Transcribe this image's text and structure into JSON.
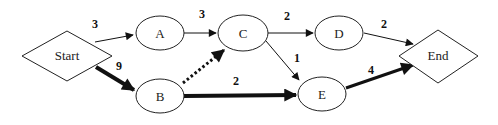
{
  "diagram": {
    "nodes": [
      {
        "id": "start",
        "label": "Start",
        "shape": "diamond"
      },
      {
        "id": "A",
        "label": "A",
        "shape": "ellipse"
      },
      {
        "id": "B",
        "label": "B",
        "shape": "ellipse"
      },
      {
        "id": "C",
        "label": "C",
        "shape": "ellipse"
      },
      {
        "id": "D",
        "label": "D",
        "shape": "ellipse"
      },
      {
        "id": "E",
        "label": "E",
        "shape": "ellipse"
      },
      {
        "id": "end",
        "label": "End",
        "shape": "diamond"
      }
    ],
    "edges": [
      {
        "from": "start",
        "to": "A",
        "weight": "3",
        "style": "thin"
      },
      {
        "from": "start",
        "to": "B",
        "weight": "9",
        "style": "bold"
      },
      {
        "from": "A",
        "to": "C",
        "weight": "3",
        "style": "thin"
      },
      {
        "from": "B",
        "to": "C",
        "weight": "",
        "style": "dotted"
      },
      {
        "from": "B",
        "to": "E",
        "weight": "2",
        "style": "bold"
      },
      {
        "from": "C",
        "to": "D",
        "weight": "2",
        "style": "thin"
      },
      {
        "from": "C",
        "to": "E",
        "weight": "1",
        "style": "thin"
      },
      {
        "from": "D",
        "to": "end",
        "weight": "2",
        "style": "thin"
      },
      {
        "from": "E",
        "to": "end",
        "weight": "4",
        "style": "bold"
      }
    ]
  }
}
